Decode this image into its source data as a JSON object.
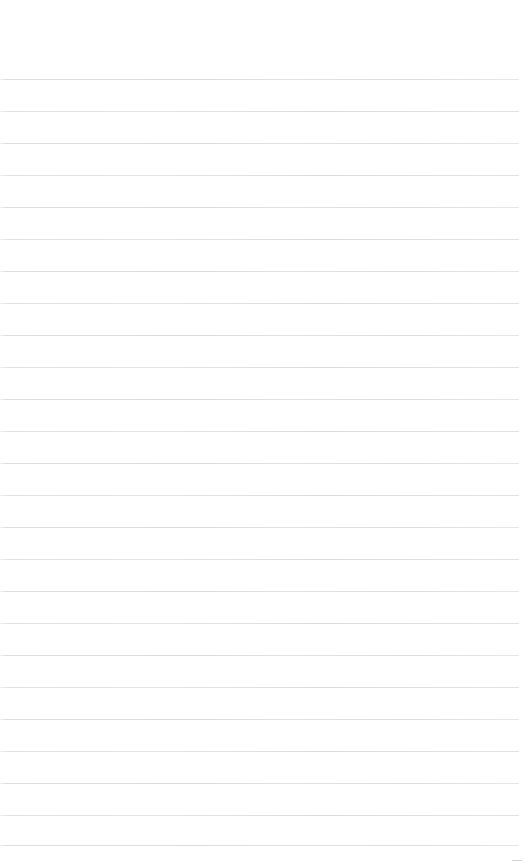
{
  "document": {
    "type": "ruled-paper",
    "title": "",
    "body_text": "",
    "page_number": "",
    "header_text": "",
    "footer_text": ""
  },
  "canvas": {
    "width": 525,
    "height": 868,
    "background_color": "#ffffff"
  },
  "ruling": {
    "line_color": "#e0e0e3",
    "line_thickness_px": 1,
    "line_spacing_px": 32,
    "first_line_y_px": 79,
    "line_start_x_px": 0,
    "line_end_x_px": 519,
    "line_count": 25,
    "top_margin_px": 79,
    "lines_y": [
      79,
      111,
      143,
      175,
      207,
      239,
      271,
      303,
      335,
      367,
      399,
      431,
      463,
      495,
      527,
      559,
      591,
      623,
      655,
      687,
      719,
      751,
      783,
      815,
      845
    ]
  },
  "artifacts": {
    "corner_dash": {
      "label": "bottom-right-dash",
      "x_px": 512,
      "y_px": 860,
      "width_px": 10,
      "color": "#d2d2d6"
    }
  }
}
